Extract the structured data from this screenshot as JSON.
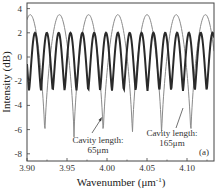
{
  "chart_data": {
    "type": "line",
    "title": "",
    "panel_label": "(a)",
    "xlabel": "Wavenumber (μm⁻¹)",
    "xlabel_main": "Wavenumber (μm",
    "xlabel_sup": "-1",
    "xlabel_close": ")",
    "ylabel": "Intensity (dB)",
    "xlim": [
      3.9,
      4.125
    ],
    "ylim": [
      -8,
      4.5
    ],
    "xticks": [
      3.9,
      3.95,
      4.0,
      4.05,
      4.1
    ],
    "xtick_labels": [
      "3.90",
      "3.95",
      "4.00",
      "4.05",
      "4.10"
    ],
    "yticks": [
      -8,
      -6,
      -4,
      -2,
      0,
      2,
      4
    ],
    "ytick_labels": [
      "-8",
      "-6",
      "-4",
      "-2",
      "0",
      "2",
      "4"
    ],
    "grid": false,
    "legend": null,
    "series": [
      {
        "name": "Cavity length: 65μm",
        "color": "#8a8a8a",
        "line_width": 1,
        "model": "periodic interference fringes",
        "period_um_inv": 0.0365,
        "max_db": 3.5,
        "min_db": -6.6,
        "peak_positions": [
          3.904,
          3.941,
          3.977,
          4.013,
          4.049,
          4.086,
          4.122
        ],
        "dip_positions": [
          3.922,
          3.959,
          3.995,
          4.031,
          4.067,
          4.104
        ]
      },
      {
        "name": "Cavity length: 165μm",
        "color": "#2a2a2a",
        "line_width": 2,
        "model": "periodic interference fringes",
        "period_um_inv": 0.0148,
        "max_db": 2.0,
        "min_db": -2.8,
        "peak_positions": [
          3.91,
          3.925,
          3.94,
          3.955,
          3.97,
          3.985,
          4.0,
          4.015,
          4.03,
          4.045,
          4.06,
          4.075,
          4.09,
          4.105,
          4.12
        ],
        "dip_positions": [
          3.903,
          3.917,
          3.932,
          3.947,
          3.962,
          3.977,
          3.992,
          4.007,
          4.022,
          4.037,
          4.052,
          4.067,
          4.082,
          4.097,
          4.112
        ]
      }
    ],
    "annotations": [
      {
        "line1": "Cavity length:",
        "line2": "65μm",
        "x_text": 3.98,
        "y_text": -6.9,
        "arrow_to": [
          3.994,
          -5.1
        ]
      },
      {
        "line1": "Cavity length:",
        "line2": "165μm",
        "x_text": 4.085,
        "y_text": -6.4,
        "arrow_to": [
          4.096,
          -4.2
        ]
      }
    ]
  }
}
